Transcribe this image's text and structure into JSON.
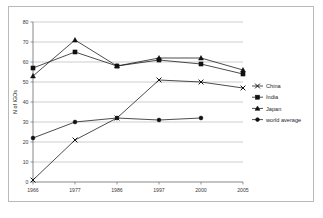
{
  "chart_data": {
    "type": "line",
    "title": "",
    "xlabel": "",
    "ylabel": "N of IGOs",
    "categories": [
      "1966",
      "1977",
      "1986",
      "1997",
      "2000",
      "2005"
    ],
    "ylim": [
      0,
      80
    ],
    "ytick_step": 10,
    "yticks": [
      "0",
      "10",
      "20",
      "30",
      "40",
      "50",
      "60",
      "70",
      "80"
    ],
    "grid": "horizontal",
    "legend_position": "right",
    "series": [
      {
        "name": "China",
        "marker": "x",
        "values": [
          1,
          21,
          32,
          51,
          50,
          47
        ]
      },
      {
        "name": "India",
        "marker": "square",
        "values": [
          57,
          65,
          58,
          61,
          59,
          54
        ]
      },
      {
        "name": "Japan",
        "marker": "triangle",
        "values": [
          53,
          71,
          58,
          62,
          62,
          56
        ]
      },
      {
        "name": "world average",
        "marker": "circle",
        "values": [
          22,
          30,
          32,
          31,
          32,
          null
        ]
      }
    ]
  },
  "legend": {
    "entries": [
      {
        "label": "China"
      },
      {
        "label": "India"
      },
      {
        "label": "Japan"
      },
      {
        "label": "world average"
      }
    ]
  },
  "colors": {
    "line": "#111111",
    "grid": "#9a9a9a",
    "axis": "#555555",
    "frame": "#b9b9b9",
    "background": "#ffffff"
  }
}
